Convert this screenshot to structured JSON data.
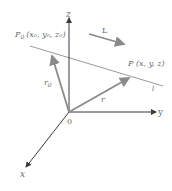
{
  "diagram": {
    "axes": {
      "x_label": "x",
      "y_label": "y",
      "z_label": "z",
      "origin_label": "0"
    },
    "points": {
      "p0_label": "P",
      "p0_sub": "0",
      "p0_coords": "(x₀, y₀, z₀)",
      "p_label": "P (x, y, z)"
    },
    "vectors": {
      "r0_label": "r",
      "r0_sub": "0",
      "r_label": "r"
    },
    "line": {
      "label": "l",
      "direction_label": "L"
    },
    "colors": {
      "axis": "#3a3a3a",
      "vector": "#8a8a8a",
      "line": "#9a9a9a",
      "text": "#6a6a6a"
    }
  }
}
